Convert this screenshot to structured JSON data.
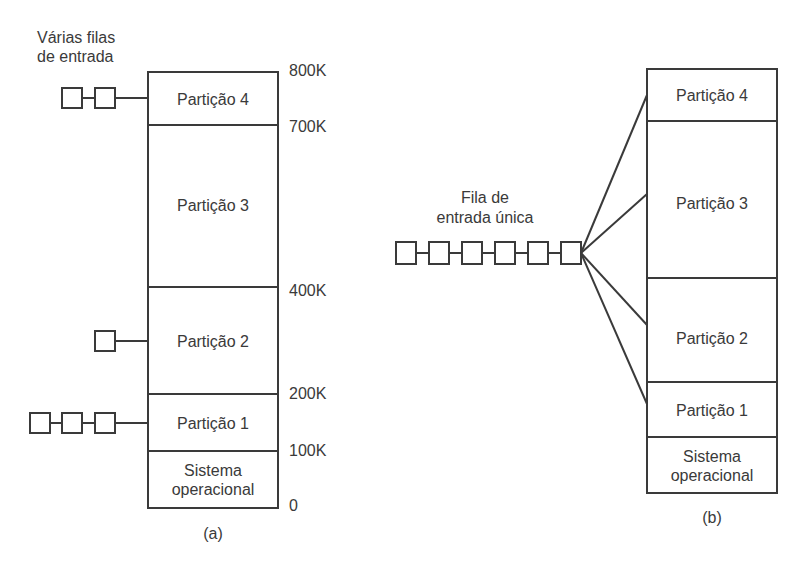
{
  "diagram_a": {
    "caption": "(a)",
    "queue_title_line1": "Várias filas",
    "queue_title_line2": "de entrada",
    "partitions": [
      {
        "label": "Partição 4",
        "queue_length": 2
      },
      {
        "label": "Partição 3",
        "queue_length": 0
      },
      {
        "label": "Partição 2",
        "queue_length": 1
      },
      {
        "label": "Partição 1",
        "queue_length": 3
      },
      {
        "label_line1": "Sistema",
        "label_line2": "operacional"
      }
    ],
    "addresses": [
      "800K",
      "700K",
      "400K",
      "200K",
      "100K",
      "0"
    ]
  },
  "diagram_b": {
    "caption": "(b)",
    "queue_title_line1": "Fila de",
    "queue_title_line2": "entrada única",
    "queue_length": 6,
    "partitions": [
      {
        "label": "Partição 4"
      },
      {
        "label": "Partição 3"
      },
      {
        "label": "Partição 2"
      },
      {
        "label": "Partição 1"
      },
      {
        "label_line1": "Sistema",
        "label_line2": "operacional"
      }
    ]
  },
  "colors": {
    "line": "#3a3a3a",
    "background": "#ffffff"
  }
}
